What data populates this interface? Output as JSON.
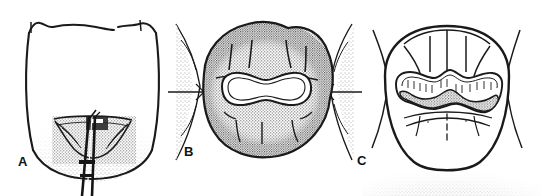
{
  "figure": {
    "background_color": "#ffffff",
    "ink_color": "#1a1a1a",
    "shade_color": "#9a9a9a",
    "fill_color": "#b5b5b5",
    "width": 544,
    "height": 196,
    "panels": [
      {
        "id": "A",
        "label": "A",
        "caption_letter": "A",
        "view": "buccal-view-of-molar-with-matrix-band-instrument",
        "description": "Buccal (facial) line drawing of a posterior tooth crown with stippled cervical shading and a thin double-pronged instrument inserted at the gingival margin",
        "center_x": 92,
        "center_y": 92
      },
      {
        "id": "B",
        "label": "B",
        "caption_letter": "B",
        "view": "occlusal-view-cavity-preparation",
        "description": "Occlusal view of a molar with a dog-bone shaped cavity preparation outline, flanked by adjacent teeth with contact marks",
        "center_x": 265,
        "center_y": 90
      },
      {
        "id": "C",
        "label": "C",
        "caption_letter": "C",
        "view": "occlusal-view-completed-restoration",
        "description": "Occlusal view of the same molar with the completed stippled restoration filling the preparation and gingival shading below",
        "center_x": 447,
        "center_y": 96
      }
    ]
  },
  "labels": {
    "a": "A",
    "b": "B",
    "c": "C"
  }
}
